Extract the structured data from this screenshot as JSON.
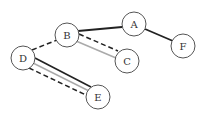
{
  "diagram": {
    "type": "graph",
    "nodes": [
      {
        "id": "A",
        "label": "A",
        "x": 134,
        "y": 24
      },
      {
        "id": "B",
        "label": "B",
        "x": 67,
        "y": 35
      },
      {
        "id": "C",
        "label": "C",
        "x": 127,
        "y": 61
      },
      {
        "id": "D",
        "label": "D",
        "x": 23,
        "y": 58
      },
      {
        "id": "E",
        "label": "E",
        "x": 98,
        "y": 97
      },
      {
        "id": "F",
        "label": "F",
        "x": 183,
        "y": 46
      }
    ],
    "edges": [
      {
        "from": "B",
        "to": "A",
        "style": "solid-dark"
      },
      {
        "from": "A",
        "to": "F",
        "style": "solid-dark"
      },
      {
        "from": "D",
        "to": "B",
        "style": "dashed-dark"
      },
      {
        "from": "B",
        "to": "C",
        "style": "dashed-dark"
      },
      {
        "from": "B",
        "to": "C",
        "style": "solid-light"
      },
      {
        "from": "D",
        "to": "E",
        "style": "solid-dark"
      },
      {
        "from": "D",
        "to": "E",
        "style": "solid-light"
      },
      {
        "from": "D",
        "to": "E",
        "style": "dashed-dark"
      }
    ],
    "colors": {
      "dark": "#222222",
      "light": "#aaaaaa",
      "node_stroke": "#555555"
    }
  }
}
